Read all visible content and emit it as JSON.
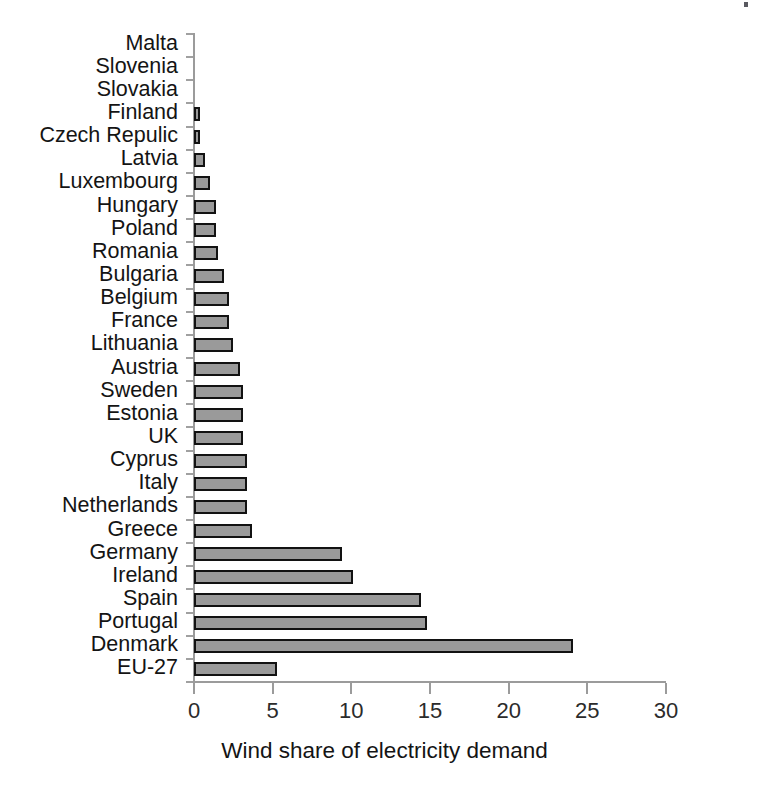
{
  "chart_data": {
    "type": "bar",
    "orientation": "horizontal",
    "title": "",
    "xlabel": "Wind share of electricity demand",
    "ylabel": "",
    "xlim": [
      0,
      30
    ],
    "xticks": [
      0,
      5,
      10,
      15,
      20,
      25,
      30
    ],
    "xtick_labels": [
      "0",
      "5",
      "10",
      "15",
      "20",
      "25",
      "30"
    ],
    "grid": false,
    "legend": null,
    "bar_fill_color": "#9a9a9a",
    "bar_edge_color": "#121212",
    "axis_color": "#9b9b9b",
    "categories": [
      "Malta",
      "Slovenia",
      "Slovakia",
      "Finland",
      "Czech Repulic",
      "Latvia",
      "Luxembourg",
      "Hungary",
      "Poland",
      "Romania",
      "Bulgaria",
      "Belgium",
      "France",
      "Lithuania",
      "Austria",
      "Sweden",
      "Estonia",
      "UK",
      "Cyprus",
      "Italy",
      "Netherlands",
      "Greece",
      "Germany",
      "Ireland",
      "Spain",
      "Portugal",
      "Denmark",
      "EU-27"
    ],
    "values": [
      0,
      0,
      0,
      0.35,
      0.4,
      0.7,
      1.0,
      1.4,
      1.4,
      1.5,
      1.9,
      2.2,
      2.2,
      2.5,
      2.9,
      3.1,
      3.1,
      3.1,
      3.4,
      3.4,
      3.4,
      3.7,
      9.4,
      10.1,
      14.4,
      14.8,
      24.1,
      5.3
    ]
  },
  "xaxis": {
    "title": "Wind share of electricity demand"
  }
}
